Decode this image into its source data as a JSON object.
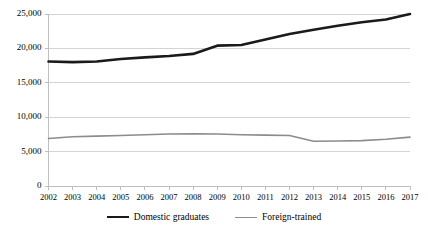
{
  "chart_data": {
    "type": "line",
    "title": "",
    "subtitle": "",
    "xlabel": "",
    "ylabel": "",
    "xlim": [
      2002,
      2017
    ],
    "ylim": [
      0,
      25000
    ],
    "grid": true,
    "legend_position": "bottom",
    "categories": [
      2002,
      2003,
      2004,
      2005,
      2006,
      2007,
      2008,
      2009,
      2010,
      2011,
      2012,
      2013,
      2014,
      2015,
      2016,
      2017
    ],
    "x_tick_labels": [
      "2002",
      "2003",
      "2004",
      "2005",
      "2006",
      "2007",
      "2008",
      "2009",
      "2010",
      "2011",
      "2012",
      "2013",
      "2014",
      "2015",
      "2016",
      "2017"
    ],
    "y_tick_labels": [
      "0",
      "5,000",
      "10,000",
      "15,000",
      "20,000",
      "25,000"
    ],
    "y_ticks": [
      0,
      5000,
      10000,
      15000,
      20000,
      25000
    ],
    "series": [
      {
        "name": "Domestic graduates",
        "color": "#1a1a1a",
        "width": 2.6,
        "values": [
          18100,
          18000,
          18100,
          18450,
          18700,
          18900,
          19200,
          20400,
          20500,
          21300,
          22100,
          22700,
          23300,
          23800,
          24200,
          25000
        ]
      },
      {
        "name": "Foreign-trained",
        "color": "#8c8c8c",
        "width": 1.6,
        "values": [
          6900,
          7150,
          7250,
          7350,
          7450,
          7550,
          7600,
          7550,
          7450,
          7400,
          7350,
          6500,
          6550,
          6600,
          6800,
          7100
        ]
      }
    ]
  },
  "legend": {
    "items": [
      {
        "label": "Domestic graduates",
        "color": "#1a1a1a",
        "width": 2.6
      },
      {
        "label": "Foreign-trained",
        "color": "#8c8c8c",
        "width": 1.6
      }
    ]
  },
  "axes": {
    "axis_color": "#bfbfbf",
    "grid_color": "#d4d4d4"
  }
}
